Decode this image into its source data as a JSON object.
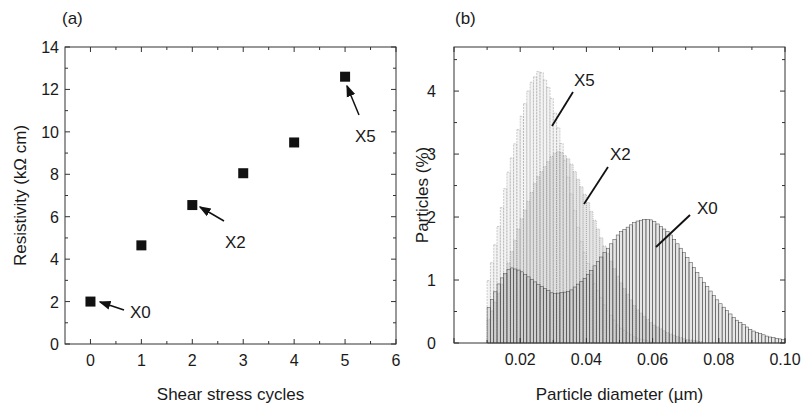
{
  "chart_data": [
    {
      "panel": "(a)",
      "type": "scatter",
      "title": "",
      "xlabel": "Shear stress cycles",
      "ylabel": "Resistivity (kΩ cm)",
      "xlim": [
        -0.5,
        6
      ],
      "ylim": [
        0,
        14
      ],
      "xticks": [
        0,
        1,
        2,
        3,
        4,
        5,
        6
      ],
      "yticks": [
        0,
        2,
        4,
        6,
        8,
        10,
        12,
        14
      ],
      "grid": false,
      "series": [
        {
          "name": "Resistivity",
          "marker": "square",
          "color": "#111111",
          "x": [
            0,
            1,
            2,
            3,
            4,
            5
          ],
          "y": [
            2.0,
            4.65,
            6.55,
            8.05,
            9.5,
            12.6
          ]
        }
      ],
      "annotations": [
        {
          "text": "X0",
          "x": 0,
          "y": 2.0
        },
        {
          "text": "X2",
          "x": 2,
          "y": 6.55
        },
        {
          "text": "X5",
          "x": 5,
          "y": 12.6
        }
      ]
    },
    {
      "panel": "(b)",
      "type": "bar",
      "title": "",
      "xlabel": "Particle diameter (µm)",
      "ylabel": "Particles (%)",
      "xlim": [
        0.0,
        0.1
      ],
      "ylim": [
        0,
        4.7
      ],
      "xticks": [
        "0.02",
        "0.04",
        "0.06",
        "0.08",
        "0.10"
      ],
      "yticks": [
        0,
        1,
        2,
        3,
        4
      ],
      "grid": false,
      "series": [
        {
          "name": "X0",
          "description": "bimodal histogram, small peak ~1.2% at 0.017 µm, minimum ~0.78% at 0.030 µm, main peak ~1.97% at 0.058 µm, tail to 0.10 µm",
          "color": "#555555",
          "x": [
            0.01,
            0.014,
            0.017,
            0.02,
            0.025,
            0.03,
            0.035,
            0.04,
            0.045,
            0.05,
            0.055,
            0.058,
            0.06,
            0.065,
            0.07,
            0.075,
            0.08,
            0.085,
            0.09,
            0.095,
            0.1
          ],
          "y": [
            0.5,
            1.0,
            1.2,
            1.15,
            0.95,
            0.78,
            0.82,
            1.05,
            1.4,
            1.75,
            1.93,
            1.97,
            1.95,
            1.75,
            1.4,
            1.0,
            0.65,
            0.38,
            0.2,
            0.1,
            0.05
          ]
        },
        {
          "name": "X2",
          "description": "peak ~3.05% at 0.032 µm",
          "color": "#888888",
          "x": [
            0.01,
            0.015,
            0.02,
            0.025,
            0.03,
            0.032,
            0.035,
            0.04,
            0.045,
            0.05,
            0.055,
            0.06,
            0.065,
            0.07,
            0.075
          ],
          "y": [
            0.3,
            1.0,
            1.9,
            2.6,
            3.0,
            3.05,
            2.9,
            2.3,
            1.6,
            1.0,
            0.55,
            0.3,
            0.15,
            0.06,
            0.02
          ]
        },
        {
          "name": "X5",
          "description": "peak ~4.35% at 0.026 µm",
          "color": "#aaaaaa",
          "x": [
            0.01,
            0.013,
            0.016,
            0.02,
            0.023,
            0.026,
            0.029,
            0.032,
            0.035,
            0.038,
            0.042,
            0.046,
            0.05,
            0.055,
            0.06
          ],
          "y": [
            0.85,
            1.7,
            2.6,
            3.5,
            4.1,
            4.35,
            4.0,
            3.3,
            2.5,
            1.7,
            1.0,
            0.55,
            0.25,
            0.08,
            0.02
          ]
        }
      ],
      "annotations": [
        {
          "text": "X5",
          "x": 0.039,
          "y": 4.3
        },
        {
          "text": "X2",
          "x": 0.05,
          "y": 3.0
        },
        {
          "text": "X0",
          "x": 0.075,
          "y": 2.2
        }
      ]
    }
  ]
}
